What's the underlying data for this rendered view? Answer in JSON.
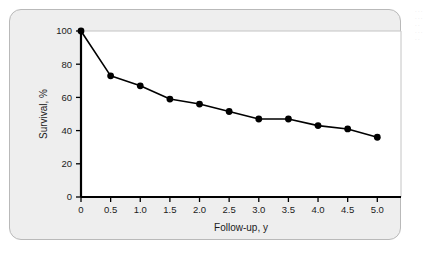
{
  "figure": {
    "background_color": "#eeeeee",
    "border_color": "#b9b9b9",
    "plot_background_color": "#ffffff",
    "series_color": "#000000"
  },
  "edge_artifact": {
    "line1": "· · ·",
    "line2": "· · ·",
    "line3": "· ·",
    "line4": "· · ·",
    "line5": "· ·"
  },
  "chart_data": {
    "type": "line",
    "title": "",
    "subtitle": "",
    "xlabel": "Follow-up, y",
    "ylabel": "Survival, %",
    "xlim": [
      0,
      5.4
    ],
    "ylim": [
      0,
      100
    ],
    "xticks": [
      0,
      0.5,
      1.0,
      1.5,
      2.0,
      2.5,
      3.0,
      3.5,
      4.0,
      4.5,
      5.0
    ],
    "xtick_labels": [
      "0",
      "0.5",
      "1.0",
      "1.5",
      "2.0",
      "2.5",
      "3.0",
      "3.5",
      "4.0",
      "4.5",
      "5.0"
    ],
    "yticks": [
      0,
      20,
      40,
      60,
      80,
      100
    ],
    "ytick_labels": [
      "0",
      "20",
      "40",
      "60",
      "80",
      "100"
    ],
    "grid": false,
    "legend": null,
    "marker": "circle",
    "x": [
      0,
      0.5,
      1.0,
      1.5,
      2.0,
      2.5,
      3.0,
      3.5,
      4.0,
      4.5,
      5.0
    ],
    "values": [
      100,
      73,
      67,
      59,
      56,
      51.5,
      47,
      47,
      43,
      41,
      36
    ],
    "series": [
      {
        "name": "Survival",
        "x": [
          0,
          0.5,
          1.0,
          1.5,
          2.0,
          2.5,
          3.0,
          3.5,
          4.0,
          4.5,
          5.0
        ],
        "values": [
          100,
          73,
          67,
          59,
          56,
          51.5,
          47,
          47,
          43,
          41,
          36
        ]
      }
    ],
    "annotations": []
  }
}
